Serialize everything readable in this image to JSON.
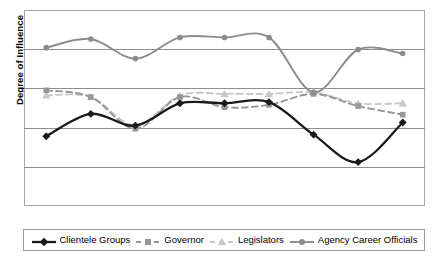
{
  "chart_data": {
    "type": "line",
    "title": "",
    "subtitle": "",
    "xlabel": "",
    "ylabel": "Degree of Influence",
    "x": [
      1,
      2,
      3,
      4,
      5,
      6,
      7,
      8,
      9
    ],
    "xtick_labels": [],
    "ytick_labels": [],
    "ylim": [
      0,
      5
    ],
    "xlim": [
      0.5,
      9.5
    ],
    "grid": "horizontal",
    "gridline_count": 4,
    "legend_position": "bottom",
    "smoothed": true,
    "series": [
      {
        "name": "Clientele Groups",
        "color": "#1a1a1a",
        "marker": "diamond",
        "dash": "solid",
        "width": 2.3,
        "values": [
          1.78,
          2.35,
          2.05,
          2.62,
          2.62,
          2.65,
          1.82,
          1.12,
          2.13
        ]
      },
      {
        "name": "Governor",
        "color": "#969696",
        "marker": "square",
        "dash": "dashed",
        "width": 1.9,
        "values": [
          2.95,
          2.78,
          1.97,
          2.78,
          2.52,
          2.58,
          2.86,
          2.55,
          2.33
        ]
      },
      {
        "name": "Legislators",
        "color": "#c8c8c8",
        "marker": "triangle",
        "dash": "dashed",
        "width": 1.9,
        "values": [
          2.82,
          2.78,
          2.05,
          2.82,
          2.86,
          2.86,
          2.9,
          2.62,
          2.62
        ]
      },
      {
        "name": "Agency Career Officials",
        "color": "#8c8c8c",
        "marker": "circle",
        "dash": "solid",
        "width": 1.9,
        "values": [
          4.04,
          4.26,
          3.76,
          4.3,
          4.3,
          4.3,
          2.9,
          3.99,
          3.89
        ]
      }
    ]
  },
  "legend": {
    "items": [
      {
        "label": "Clientele Groups"
      },
      {
        "label": "Governor"
      },
      {
        "label": "Legislators"
      },
      {
        "label": "Agency Career Officials"
      }
    ]
  },
  "axes": {
    "y_title": "Degree of Influence"
  },
  "colors": {
    "frame": "#a8a8a8",
    "gridline": "#8f8f8f",
    "legend_border": "#9a9a9a",
    "background": "#ffffff",
    "text": "#000000"
  }
}
